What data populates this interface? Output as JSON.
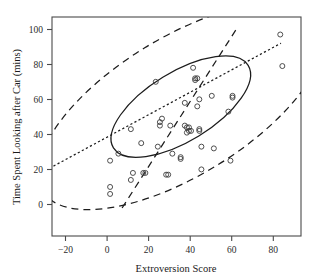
{
  "chart_data": {
    "type": "scatter",
    "title": "",
    "xlabel": "Extroversion Score",
    "ylabel": "Time Spent Looking after Car (mins)",
    "xlim": [
      -26,
      94
    ],
    "ylim": [
      -18,
      107
    ],
    "xticks": [
      -20,
      0,
      20,
      40,
      60,
      80
    ],
    "xticklabels": [
      "−20",
      "0",
      "20",
      "40",
      "60",
      "80"
    ],
    "yticks": [
      0,
      20,
      40,
      60,
      80,
      100
    ],
    "yticklabels": [
      "0",
      "20",
      "40",
      "60",
      "80",
      "100"
    ],
    "grid": false,
    "legend": null,
    "marker": "open-circle",
    "points": [
      [
        2,
        10
      ],
      [
        2,
        6
      ],
      [
        2,
        25
      ],
      [
        6,
        29
      ],
      [
        12,
        43
      ],
      [
        12,
        14
      ],
      [
        13,
        18
      ],
      [
        17,
        35
      ],
      [
        18,
        18
      ],
      [
        19,
        18
      ],
      [
        24,
        70
      ],
      [
        25,
        33
      ],
      [
        26,
        45
      ],
      [
        26,
        47
      ],
      [
        27,
        49
      ],
      [
        29,
        17
      ],
      [
        30,
        17
      ],
      [
        31,
        45
      ],
      [
        32,
        29
      ],
      [
        36,
        26
      ],
      [
        36,
        27
      ],
      [
        38,
        58
      ],
      [
        38,
        45
      ],
      [
        39,
        44
      ],
      [
        39,
        41
      ],
      [
        40,
        42
      ],
      [
        40,
        44
      ],
      [
        41,
        42
      ],
      [
        42,
        78
      ],
      [
        43,
        71
      ],
      [
        43,
        72
      ],
      [
        44,
        72
      ],
      [
        44,
        56
      ],
      [
        45,
        60
      ],
      [
        45,
        43
      ],
      [
        45,
        42
      ],
      [
        46,
        33
      ],
      [
        46,
        20
      ],
      [
        51,
        62
      ],
      [
        52,
        32
      ],
      [
        59,
        53
      ],
      [
        60,
        25
      ],
      [
        61,
        61
      ],
      [
        61,
        62
      ],
      [
        84,
        97
      ],
      [
        85,
        79
      ]
    ],
    "overlays": [
      {
        "name": "inner-confidence-ellipse",
        "type": "ellipse",
        "style": "solid",
        "center": [
          36,
          43
        ],
        "semi_major": 38,
        "semi_minor": 17,
        "angle_deg": 37
      },
      {
        "name": "outer-confidence-ellipse",
        "type": "ellipse",
        "style": "dashed",
        "center": [
          36,
          43
        ],
        "semi_major": 78,
        "semi_minor": 34,
        "angle_deg": 37
      },
      {
        "name": "regression-line",
        "type": "line",
        "style": "dotted",
        "from": [
          -19,
          9
        ],
        "to": [
          91,
          79
        ]
      },
      {
        "name": "major-axis-line",
        "type": "line",
        "style": "dashed",
        "from": [
          14,
          -15
        ],
        "to": [
          69,
          101
        ]
      }
    ]
  },
  "figure": {
    "caption": ""
  }
}
